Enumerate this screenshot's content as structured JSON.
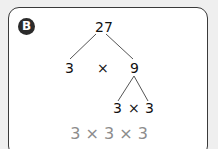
{
  "panel": {
    "label": "B"
  },
  "tree": {
    "root": "27",
    "level1_left": "3",
    "level1_op": "×",
    "level1_right": "9",
    "level2_left": "3",
    "level2_op": "×",
    "level2_right": "3"
  },
  "result": "3 × 3 × 3",
  "colors": {
    "background": "#efefef",
    "card": "#ffffff",
    "badge": "#2b2b2b",
    "result_text": "#8c8c8c"
  }
}
